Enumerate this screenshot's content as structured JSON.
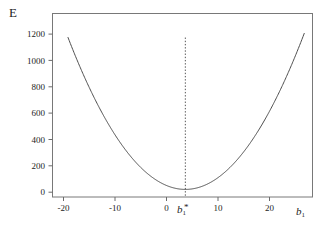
{
  "chart_data": {
    "type": "line",
    "title": "",
    "subtitle": "",
    "xlabel": "b1",
    "ylabel": "E",
    "xlabel_display": "b",
    "xlabel_sub": "1",
    "ylabel_display": "E",
    "grid": false,
    "legend": false,
    "legend_position": "none",
    "xlim": [
      -23.5,
      26.8
    ],
    "ylim": [
      -60,
      1390
    ],
    "xticks": [
      -20,
      -10,
      0,
      10,
      20
    ],
    "xtick_labels": [
      "-20",
      "-10",
      "0",
      "10",
      "20"
    ],
    "yticks": [
      0,
      200,
      400,
      600,
      800,
      1000,
      1200
    ],
    "ytick_labels": [
      "0",
      "200",
      "400",
      "600",
      "800",
      "1000",
      "1200"
    ],
    "series": [
      {
        "name": "E(b1)",
        "kind": "parabola",
        "color": "#4d4d4d",
        "vertex_x": 2.2,
        "vertex_y": 0,
        "coefficient_a": 2.33,
        "x_start": -20.5,
        "x_end": 25.2,
        "x": [
          -20.5,
          -19,
          -17.5,
          -16,
          -14.5,
          -13,
          -11.5,
          -10,
          -8.5,
          -7,
          -5.5,
          -4,
          -2.5,
          -1,
          0.5,
          2.2,
          4,
          5.5,
          7,
          8.5,
          10,
          11.5,
          13,
          14.5,
          16,
          17.5,
          19,
          20.5,
          22,
          23.5,
          25.2
        ],
        "values": [
          1309,
          1153,
          1005,
          865,
          734,
          611,
          496,
          390,
          291,
          201,
          138,
          90,
          51,
          24,
          6,
          0,
          7,
          25,
          54,
          93,
          143,
          203,
          274,
          355,
          447,
          549,
          662,
          785,
          918,
          1062,
          1228
        ]
      }
    ],
    "annotations": [
      {
        "type": "vline",
        "name": "optimum-line",
        "x": 2.2,
        "y_from": 0,
        "y_to": 1200,
        "style": "dotted",
        "color": "#555555",
        "label": "b1*",
        "label_display": "b",
        "label_sub": "1",
        "label_star": "*"
      }
    ]
  },
  "figure": {
    "frame_color": "#707070",
    "background": "#ffffff",
    "curve_color": "#4d4d4d"
  }
}
